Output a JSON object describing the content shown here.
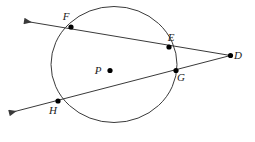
{
  "figure": {
    "type": "geometry-diagram",
    "background_color": "#ffffff",
    "stroke_color": "#3a3a3a",
    "label_color": "#1b1b1b",
    "dot_color": "#000000",
    "width": 255,
    "height": 142
  },
  "circle": {
    "name": "circle-P",
    "cx": 114,
    "cy": 64.5,
    "rx": 63,
    "ry": 58,
    "stroke_width": 1
  },
  "points": [
    {
      "id": "F",
      "label": "F",
      "x": 71,
      "y": 27,
      "label_x": 66,
      "label_y": 20,
      "on_circle": true
    },
    {
      "id": "E",
      "label": "E",
      "x": 169,
      "y": 47,
      "label_x": 171,
      "label_y": 41,
      "on_circle": true
    },
    {
      "id": "D",
      "label": "D",
      "x": 230.5,
      "y": 55.5,
      "label_x": 238,
      "label_y": 59,
      "on_circle": false
    },
    {
      "id": "G",
      "label": "G",
      "x": 176,
      "y": 70.5,
      "label_x": 181,
      "label_y": 81,
      "on_circle": true
    },
    {
      "id": "H",
      "label": "H",
      "x": 58,
      "y": 101,
      "label_x": 53,
      "label_y": 114,
      "on_circle": true
    },
    {
      "id": "P",
      "label": "P",
      "x": 110,
      "y": 70.5,
      "label_x": 98,
      "label_y": 74,
      "on_circle": false
    }
  ],
  "lines": [
    {
      "id": "secant-DEF",
      "name": "secant-line-d-e-f",
      "from_x": 230.5,
      "from_y": 55.5,
      "to_x": 24,
      "to_y": 21,
      "arrow_end": true,
      "arrow_start": false,
      "passes_through": [
        "D",
        "E",
        "F"
      ]
    },
    {
      "id": "secant-DGH",
      "name": "secant-line-d-g-h",
      "from_x": 230.5,
      "from_y": 55.5,
      "to_x": 9,
      "to_y": 113,
      "arrow_end": true,
      "arrow_start": false,
      "passes_through": [
        "D",
        "G",
        "H"
      ]
    }
  ]
}
